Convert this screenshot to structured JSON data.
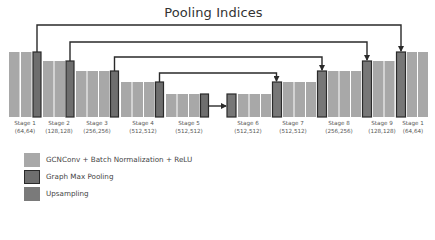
{
  "title": "Pooling Indices",
  "colors": {
    "conv": "#a8a8a8",
    "pool": "#6e6e6e",
    "upsample": "#777777",
    "border": "#2a2a2a",
    "line": "#2a2a2a"
  },
  "stages": [
    {
      "label": "Stage 1",
      "size": "(64,64)"
    },
    {
      "label": "Stage 2",
      "size": "(128,128)"
    },
    {
      "label": "Stage 3",
      "size": "(256,256)"
    },
    {
      "label": "Stage 4",
      "size": "(512,512)"
    },
    {
      "label": "Stage 5",
      "size": "(512,512)"
    },
    {
      "label": "Stage 6",
      "size": "(512,512)"
    },
    {
      "label": "Stage 7",
      "size": "(512,512)"
    },
    {
      "label": "Stage 8",
      "size": "(256,256)"
    },
    {
      "label": "Stage 9",
      "size": "(128,128)"
    },
    {
      "label": "Stage 1",
      "size": "(64,64)"
    }
  ],
  "legend": [
    {
      "label": "GCNConv + Batch Normalization + ReLU",
      "kind": "conv"
    },
    {
      "label": "Graph Max Pooling",
      "kind": "pool"
    },
    {
      "label": "Upsampling",
      "kind": "upsample"
    }
  ]
}
